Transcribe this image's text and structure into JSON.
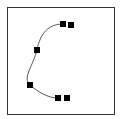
{
  "diagram": {
    "type": "bezier-curve",
    "frame": {
      "x": 7,
      "y": 7,
      "width": 107,
      "height": 107,
      "stroke": "#333333"
    },
    "curve": {
      "stroke": "#555555",
      "path": "M63,24 C48,24 40,34 37,50 C33,66 22,78 30,85 C38,92 48,98 58,98"
    },
    "points": [
      {
        "x": 63,
        "y": 24
      },
      {
        "x": 71,
        "y": 25
      },
      {
        "x": 37,
        "y": 50
      },
      {
        "x": 30,
        "y": 85
      },
      {
        "x": 58,
        "y": 98
      },
      {
        "x": 67,
        "y": 98
      }
    ],
    "point_size": 6,
    "point_color": "#000000"
  }
}
